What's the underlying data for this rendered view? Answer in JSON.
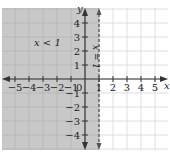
{
  "chart_data": {
    "type": "inequality-graph",
    "title": "",
    "xlabel": "x",
    "ylabel": "y",
    "xlim": [
      -5.8,
      6
    ],
    "ylim": [
      -4.8,
      5.2
    ],
    "x_ticks": [
      -5,
      -4,
      -3,
      -2,
      -1,
      1,
      2,
      3,
      4,
      5
    ],
    "y_ticks": [
      -4,
      -3,
      -2,
      -1,
      1,
      2,
      3,
      4
    ],
    "origin_label": "0",
    "grid": true,
    "boundary": {
      "equation": "x = 1",
      "x": 1,
      "style": "dashed",
      "orientation": "vertical"
    },
    "shaded_region": {
      "inequality": "x < 1",
      "side": "left"
    },
    "annotations": [
      {
        "text": "x < 1",
        "x": -4,
        "y": 2.3
      },
      {
        "text": "x = 1",
        "x": 0.55,
        "y": 1.5,
        "rotation": -90
      }
    ]
  },
  "colors": {
    "shade": "#c8c8c8",
    "grid_shaded": "#b4b4b4",
    "grid_unshaded": "#d6d6d6",
    "axis": "#333333",
    "boundary": "#555555"
  },
  "labels": {
    "x_axis": "x",
    "y_axis": "y",
    "origin": "0",
    "region": "x < 1",
    "boundary": "x = 1"
  }
}
